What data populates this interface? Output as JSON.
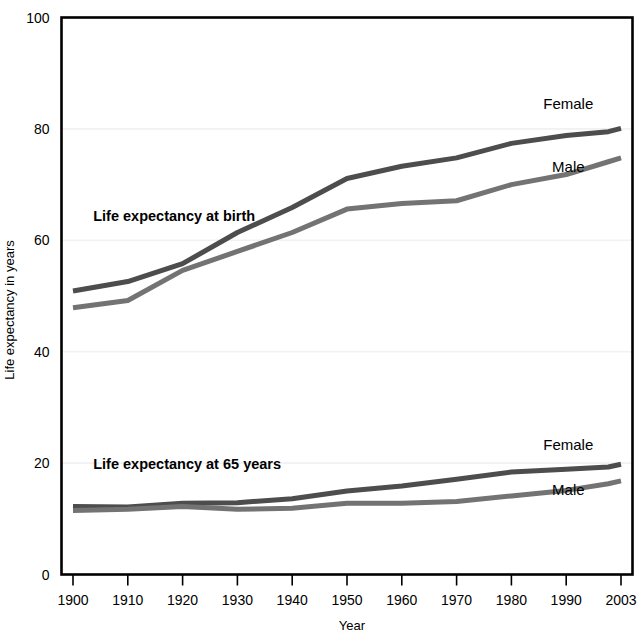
{
  "chart_data": {
    "type": "line",
    "title": "",
    "xlabel": "Year",
    "ylabel": "Life expectancy in years",
    "xlim": [
      1900,
      2003
    ],
    "ylim": [
      0,
      100
    ],
    "grid": true,
    "legend_position": "inline-right",
    "x": [
      1900,
      1910,
      1920,
      1930,
      1940,
      1950,
      1960,
      1970,
      1980,
      1990,
      2000,
      2003
    ],
    "xtick_labels": [
      "1900",
      "1910",
      "1920",
      "1930",
      "1940",
      "1950",
      "1960",
      "1970",
      "1980",
      "1990",
      "2003"
    ],
    "xticks": [
      1900,
      1910,
      1920,
      1930,
      1940,
      1950,
      1960,
      1970,
      1980,
      1990,
      2003
    ],
    "ytick_labels": [
      "0",
      "20",
      "40",
      "60",
      "80",
      "100"
    ],
    "yticks": [
      0,
      20,
      40,
      60,
      80,
      100
    ],
    "annotations": [
      {
        "text": "Life expectancy at birth",
        "x": 1901.5,
        "y": 63.5
      },
      {
        "text": "Life expectancy at 65 years",
        "x": 1901.5,
        "y": 19.0
      }
    ],
    "series": [
      {
        "name": "Life expectancy at birth — Female",
        "group": "Life expectancy at birth",
        "sex": "Female",
        "color": "#4d4d4d",
        "label": "Female",
        "label_x": 1990.5,
        "label_y": 83.5,
        "values": [
          50.9,
          52.6,
          55.8,
          61.4,
          65.9,
          71.1,
          73.3,
          74.8,
          77.4,
          78.8,
          79.5,
          80.1
        ]
      },
      {
        "name": "Life expectancy at birth — Male",
        "group": "Life expectancy at birth",
        "sex": "Male",
        "color": "#737373",
        "label": "Male",
        "label_x": 1990.5,
        "label_y": 72.2,
        "values": [
          47.9,
          49.2,
          54.6,
          58.0,
          61.4,
          65.6,
          66.6,
          67.1,
          70.0,
          71.8,
          74.1,
          74.8
        ]
      },
      {
        "name": "Life expectancy at 65 years — Female",
        "group": "Life expectancy at 65 years",
        "sex": "Female",
        "color": "#4d4d4d",
        "label": "Female",
        "label_x": 1990.5,
        "label_y": 22.3,
        "values": [
          12.2,
          12.1,
          12.8,
          12.9,
          13.6,
          15.0,
          15.9,
          17.1,
          18.4,
          18.9,
          19.3,
          19.8
        ]
      },
      {
        "name": "Life expectancy at 65 years — Male",
        "group": "Life expectancy at 65 years",
        "sex": "Male",
        "color": "#737373",
        "label": "Male",
        "label_x": 1990.5,
        "label_y": 14.2,
        "values": [
          11.5,
          11.7,
          12.2,
          11.7,
          11.9,
          12.8,
          12.8,
          13.1,
          14.1,
          15.1,
          16.3,
          16.8
        ]
      }
    ],
    "colors": {
      "female_line": "#4d4d4d",
      "male_line": "#737373",
      "axis": "#000000",
      "grid": "#f1f1f4",
      "background": "#ffffff"
    }
  }
}
